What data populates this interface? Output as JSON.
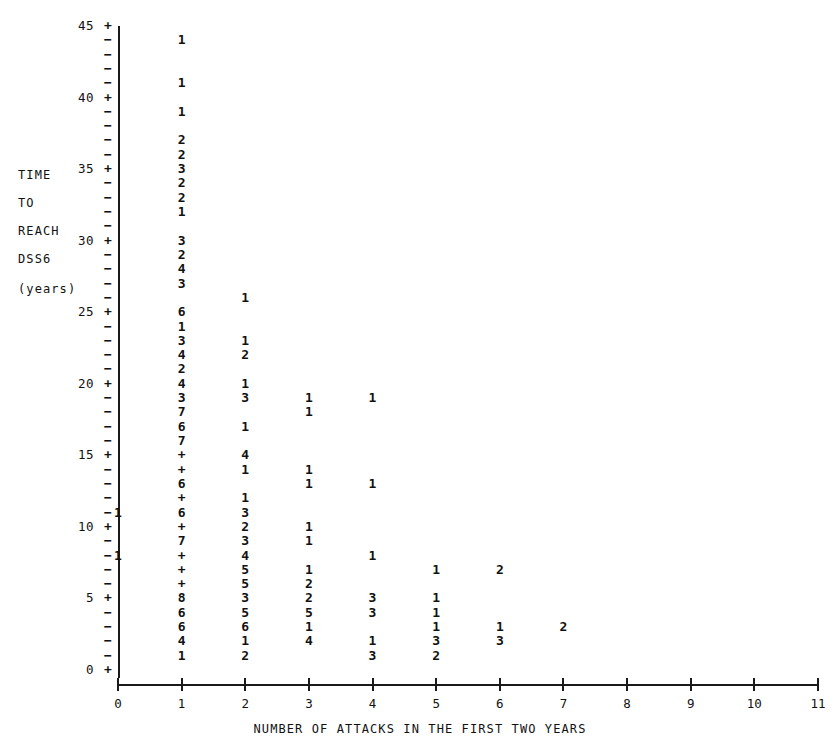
{
  "axes": {
    "y_title_lines": [
      "TIME",
      "TO",
      "REACH",
      "DSS6",
      "(years)"
    ],
    "x_title": "NUMBER OF ATTACKS IN THE FIRST TWO YEARS",
    "y_major_labels": [
      "45",
      "40",
      "35",
      "30",
      "25",
      "20",
      "15",
      "10",
      "5",
      "0"
    ],
    "x_labels": [
      "0",
      "1",
      "2",
      "3",
      "4",
      "5",
      "6",
      "7",
      "8",
      "9",
      "10",
      "11"
    ],
    "y_major_tick_glyph": "+",
    "y_minor_tick_glyph": "−",
    "axis_color": "#1a1a1a",
    "text_color": "#111111"
  },
  "chart_data": {
    "type": "scatter",
    "title": "",
    "xlabel": "NUMBER OF ATTACKS IN THE FIRST TWO YEARS",
    "ylabel": "TIME TO REACH DSS6 (years)",
    "xlim": [
      0,
      11
    ],
    "ylim": [
      0,
      45
    ],
    "grid": false,
    "legend": null,
    "note": "Character plot: each plotted glyph is the count of observations at that (x, y) grid cell; the glyph '+' means more than 9 observations (overflow).",
    "overflow_glyph": "+",
    "points": [
      {
        "x": 1,
        "y": 44,
        "label": "1"
      },
      {
        "x": 1,
        "y": 41,
        "label": "1"
      },
      {
        "x": 1,
        "y": 39,
        "label": "1"
      },
      {
        "x": 1,
        "y": 37,
        "label": "2"
      },
      {
        "x": 1,
        "y": 36,
        "label": "2"
      },
      {
        "x": 1,
        "y": 35,
        "label": "3"
      },
      {
        "x": 1,
        "y": 34,
        "label": "2"
      },
      {
        "x": 1,
        "y": 33,
        "label": "2"
      },
      {
        "x": 1,
        "y": 32,
        "label": "1"
      },
      {
        "x": 1,
        "y": 30,
        "label": "3"
      },
      {
        "x": 1,
        "y": 29,
        "label": "2"
      },
      {
        "x": 1,
        "y": 28,
        "label": "4"
      },
      {
        "x": 1,
        "y": 27,
        "label": "3"
      },
      {
        "x": 2,
        "y": 26,
        "label": "1"
      },
      {
        "x": 1,
        "y": 25,
        "label": "6"
      },
      {
        "x": 1,
        "y": 24,
        "label": "1"
      },
      {
        "x": 1,
        "y": 23,
        "label": "3"
      },
      {
        "x": 2,
        "y": 23,
        "label": "1"
      },
      {
        "x": 1,
        "y": 22,
        "label": "4"
      },
      {
        "x": 2,
        "y": 22,
        "label": "2"
      },
      {
        "x": 1,
        "y": 21,
        "label": "2"
      },
      {
        "x": 1,
        "y": 20,
        "label": "4"
      },
      {
        "x": 2,
        "y": 20,
        "label": "1"
      },
      {
        "x": 1,
        "y": 19,
        "label": "3"
      },
      {
        "x": 2,
        "y": 19,
        "label": "3"
      },
      {
        "x": 3,
        "y": 19,
        "label": "1"
      },
      {
        "x": 4,
        "y": 19,
        "label": "1"
      },
      {
        "x": 1,
        "y": 18,
        "label": "7"
      },
      {
        "x": 3,
        "y": 18,
        "label": "1"
      },
      {
        "x": 1,
        "y": 17,
        "label": "6"
      },
      {
        "x": 2,
        "y": 17,
        "label": "1"
      },
      {
        "x": 1,
        "y": 16,
        "label": "7"
      },
      {
        "x": 1,
        "y": 15,
        "label": "+"
      },
      {
        "x": 2,
        "y": 15,
        "label": "4"
      },
      {
        "x": 1,
        "y": 14,
        "label": "+"
      },
      {
        "x": 2,
        "y": 14,
        "label": "1"
      },
      {
        "x": 3,
        "y": 14,
        "label": "1"
      },
      {
        "x": 1,
        "y": 13,
        "label": "6"
      },
      {
        "x": 3,
        "y": 13,
        "label": "1"
      },
      {
        "x": 4,
        "y": 13,
        "label": "1"
      },
      {
        "x": 1,
        "y": 12,
        "label": "+"
      },
      {
        "x": 2,
        "y": 12,
        "label": "1"
      },
      {
        "x": 0,
        "y": 11,
        "label": "1"
      },
      {
        "x": 1,
        "y": 11,
        "label": "6"
      },
      {
        "x": 2,
        "y": 11,
        "label": "3"
      },
      {
        "x": 1,
        "y": 10,
        "label": "+"
      },
      {
        "x": 2,
        "y": 10,
        "label": "2"
      },
      {
        "x": 3,
        "y": 10,
        "label": "1"
      },
      {
        "x": 1,
        "y": 9,
        "label": "7"
      },
      {
        "x": 2,
        "y": 9,
        "label": "3"
      },
      {
        "x": 3,
        "y": 9,
        "label": "1"
      },
      {
        "x": 0,
        "y": 8,
        "label": "1"
      },
      {
        "x": 1,
        "y": 8,
        "label": "+"
      },
      {
        "x": 2,
        "y": 8,
        "label": "4"
      },
      {
        "x": 4,
        "y": 8,
        "label": "1"
      },
      {
        "x": 1,
        "y": 7,
        "label": "+"
      },
      {
        "x": 2,
        "y": 7,
        "label": "5"
      },
      {
        "x": 3,
        "y": 7,
        "label": "1"
      },
      {
        "x": 5,
        "y": 7,
        "label": "1"
      },
      {
        "x": 6,
        "y": 7,
        "label": "2"
      },
      {
        "x": 1,
        "y": 6,
        "label": "+"
      },
      {
        "x": 2,
        "y": 6,
        "label": "5"
      },
      {
        "x": 3,
        "y": 6,
        "label": "2"
      },
      {
        "x": 1,
        "y": 5,
        "label": "8"
      },
      {
        "x": 2,
        "y": 5,
        "label": "3"
      },
      {
        "x": 3,
        "y": 5,
        "label": "2"
      },
      {
        "x": 4,
        "y": 5,
        "label": "3"
      },
      {
        "x": 5,
        "y": 5,
        "label": "1"
      },
      {
        "x": 1,
        "y": 4,
        "label": "6"
      },
      {
        "x": 2,
        "y": 4,
        "label": "5"
      },
      {
        "x": 3,
        "y": 4,
        "label": "5"
      },
      {
        "x": 4,
        "y": 4,
        "label": "3"
      },
      {
        "x": 5,
        "y": 4,
        "label": "1"
      },
      {
        "x": 1,
        "y": 3,
        "label": "6"
      },
      {
        "x": 2,
        "y": 3,
        "label": "6"
      },
      {
        "x": 3,
        "y": 3,
        "label": "1"
      },
      {
        "x": 5,
        "y": 3,
        "label": "1"
      },
      {
        "x": 6,
        "y": 3,
        "label": "1"
      },
      {
        "x": 7,
        "y": 3,
        "label": "2"
      },
      {
        "x": 1,
        "y": 2,
        "label": "4"
      },
      {
        "x": 2,
        "y": 2,
        "label": "1"
      },
      {
        "x": 3,
        "y": 2,
        "label": "4"
      },
      {
        "x": 4,
        "y": 2,
        "label": "1"
      },
      {
        "x": 5,
        "y": 2,
        "label": "3"
      },
      {
        "x": 6,
        "y": 2,
        "label": "3"
      },
      {
        "x": 1,
        "y": 1,
        "label": "1"
      },
      {
        "x": 2,
        "y": 1,
        "label": "2"
      },
      {
        "x": 4,
        "y": 1,
        "label": "3"
      },
      {
        "x": 5,
        "y": 1,
        "label": "2"
      }
    ]
  }
}
